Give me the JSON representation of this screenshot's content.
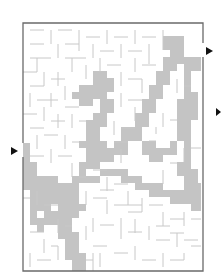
{
  "puzzle": {
    "type": "maze",
    "title": "",
    "colors": {
      "background": "#ffffff",
      "wall": "#c8c8c8",
      "border": "#6a6a6a",
      "solution_path": "#c4c4c4",
      "arrow": "#111111"
    },
    "border_box": {
      "x": 23,
      "y": 23,
      "width": 180,
      "height": 248
    },
    "grid": {
      "cols": 26,
      "rows": 36,
      "cell_size": 7
    },
    "entrance": {
      "side": "left",
      "arrow_icon": "right-pointing-triangle",
      "y": 151
    },
    "exit": {
      "side": "right",
      "arrow_icon": "right-pointing-triangle",
      "y": 51
    },
    "extra_marker": {
      "side": "right",
      "arrow_icon": "right-pointing-triangle",
      "y": 112
    },
    "solution_shown": true
  }
}
